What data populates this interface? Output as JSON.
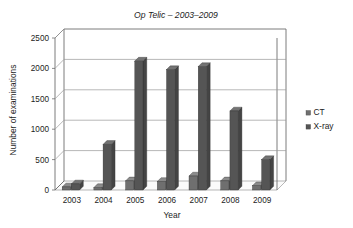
{
  "chart_data": {
    "type": "bar",
    "title": "Op Telic – 2003–2009",
    "xlabel": "Year",
    "ylabel": "Number of examinations",
    "categories": [
      "2003",
      "2004",
      "2005",
      "2006",
      "2007",
      "2008",
      "2009"
    ],
    "series": [
      {
        "name": "CT",
        "values": [
          50,
          40,
          150,
          140,
          230,
          150,
          70
        ]
      },
      {
        "name": "X-ray",
        "values": [
          100,
          750,
          2120,
          1980,
          2030,
          1300,
          500
        ]
      }
    ],
    "ylim": [
      0,
      2500
    ],
    "ytick_labels": [
      "0",
      "500",
      "1000",
      "1500",
      "2000",
      "2500"
    ],
    "ytick_values": [
      0,
      500,
      1000,
      1500,
      2000,
      2500
    ],
    "grid": true,
    "legend_position": "right",
    "style": "3d-perspective",
    "colors": {
      "ct_bar": "#6f6f6f",
      "xray_bar": "#555555",
      "gridline": "#9a9a9a",
      "axis": "#6e6e6e",
      "text": "#1c1c1c",
      "plot_background": "#ffffff"
    }
  }
}
